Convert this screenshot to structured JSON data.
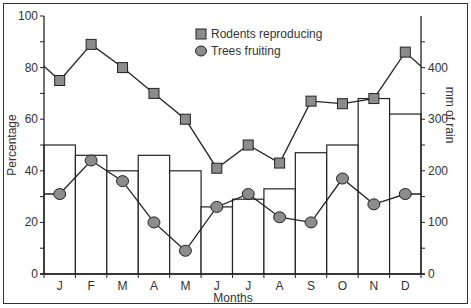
{
  "chart_data": {
    "type": "bar+line",
    "title": "",
    "xlabel": "Months",
    "ylabel": "Percentage",
    "ylabel_right": "mm of rain",
    "categories": [
      "J",
      "F",
      "M",
      "A",
      "M",
      "J",
      "J",
      "A",
      "S",
      "O",
      "N",
      "D"
    ],
    "ylim": [
      0,
      100
    ],
    "ylim_right": [
      0,
      500
    ],
    "yticks": [
      0,
      20,
      40,
      60,
      80,
      100
    ],
    "yticks_right": [
      0,
      100,
      200,
      300,
      400
    ],
    "grid": false,
    "legend_position": "top-center",
    "series": [
      {
        "name": "Rodents reproducing",
        "type": "line",
        "marker": "square",
        "axis": "left",
        "values": [
          75,
          89,
          80,
          70,
          60,
          41,
          50,
          43,
          67,
          66,
          68,
          86
        ]
      },
      {
        "name": "Trees fruiting",
        "type": "line",
        "marker": "circle",
        "axis": "left",
        "values": [
          31,
          44,
          36,
          20,
          9,
          26,
          31,
          22,
          20,
          37,
          27,
          31
        ]
      },
      {
        "name": "Rainfall",
        "type": "bar",
        "axis": "right",
        "unit": "mm",
        "values": [
          250,
          230,
          200,
          230,
          200,
          130,
          145,
          165,
          235,
          250,
          340,
          310
        ]
      }
    ]
  },
  "legend": {
    "items": [
      {
        "label": "Rodents reproducing",
        "marker": "square"
      },
      {
        "label": "Trees fruiting",
        "marker": "circle"
      }
    ]
  },
  "axes": {
    "left_title": "Percentage",
    "right_title": "mm of rain",
    "x_title": "Months",
    "left_ticks": [
      "0",
      "20",
      "40",
      "60",
      "80",
      "100"
    ],
    "right_ticks": [
      "0",
      "100",
      "200",
      "300",
      "400"
    ]
  },
  "colors": {
    "marker_fill": "#8c8c8c",
    "line": "#222222",
    "bar_fill": "#ffffff",
    "bar_stroke": "#222222",
    "text": "#333333"
  }
}
